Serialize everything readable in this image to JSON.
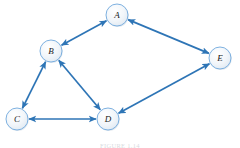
{
  "figure": {
    "caption": "FIGURE 1.14",
    "style": {
      "edge_color": "#2e75b6",
      "edge_color_dark": "#1f5fa0",
      "node_fill": "#eaf0f6",
      "node_stroke": "#6fa8dc",
      "label_color": "#1a1a1a",
      "background": "#ffffff"
    }
  },
  "graph": {
    "type": "undirected-graph",
    "node_radius": 11,
    "nodes": [
      {
        "id": "A",
        "label": "A",
        "cx": 117,
        "cy": 15
      },
      {
        "id": "B",
        "label": "B",
        "cx": 51,
        "cy": 51
      },
      {
        "id": "C",
        "label": "C",
        "cx": 17,
        "cy": 119
      },
      {
        "id": "D",
        "label": "D",
        "cx": 108,
        "cy": 119
      },
      {
        "id": "E",
        "label": "E",
        "cx": 220,
        "cy": 58
      }
    ],
    "edges": [
      {
        "id": "edge-A-B",
        "from": "A",
        "to": "B",
        "arrows": "both"
      },
      {
        "id": "edge-A-E",
        "from": "A",
        "to": "E",
        "arrows": "both"
      },
      {
        "id": "edge-B-C",
        "from": "B",
        "to": "C",
        "arrows": "both"
      },
      {
        "id": "edge-B-D",
        "from": "B",
        "to": "D",
        "arrows": "both"
      },
      {
        "id": "edge-C-D",
        "from": "C",
        "to": "D",
        "arrows": "both"
      },
      {
        "id": "edge-D-E",
        "from": "D",
        "to": "E",
        "arrows": "both"
      }
    ]
  }
}
